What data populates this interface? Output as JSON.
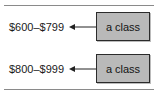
{
  "figure": {
    "background_color": "#ffffff",
    "rule_color": "#8a8a8a",
    "box_fill_color": "#b9b9b9",
    "box_border_color": "#2b2b2b",
    "text_color": "#1a1a1a",
    "rows": [
      {
        "range_label": "$600–$799",
        "arrow": "left-arrow",
        "box_label": "a class"
      },
      {
        "range_label": "$800–$999",
        "arrow": "left-arrow",
        "box_label": "a class"
      }
    ]
  }
}
